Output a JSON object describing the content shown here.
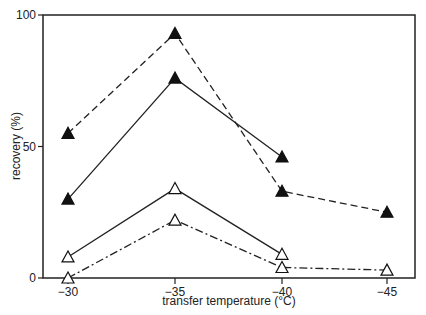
{
  "chart_data": {
    "type": "line",
    "title": "",
    "xlabel": "transfer temperature (°C)",
    "ylabel": "recovery (%)",
    "x": [
      -30,
      -35,
      -40,
      -45
    ],
    "x_tick_labels": [
      "-30",
      "-35",
      "-40",
      "-45"
    ],
    "y_tick_labels": [
      "0",
      "50",
      "100"
    ],
    "ylim": [
      0,
      100
    ],
    "grid": false,
    "legend": null,
    "series": [
      {
        "name": "filled triangle, dashed",
        "marker": "filled-triangle",
        "line": "dashed",
        "x": [
          -30,
          -35,
          -40,
          -45
        ],
        "values": [
          55,
          93,
          33,
          25
        ]
      },
      {
        "name": "filled triangle, solid",
        "marker": "filled-triangle",
        "line": "solid",
        "x": [
          -30,
          -35,
          -40
        ],
        "values": [
          30,
          76,
          46
        ]
      },
      {
        "name": "open triangle, solid",
        "marker": "open-triangle",
        "line": "solid",
        "x": [
          -30,
          -35,
          -40
        ],
        "values": [
          8,
          34,
          9
        ]
      },
      {
        "name": "open triangle, dash-dot",
        "marker": "open-triangle",
        "line": "dashdot",
        "x": [
          -30,
          -35,
          -40,
          -45
        ],
        "values": [
          0,
          22,
          4,
          3
        ]
      }
    ]
  }
}
